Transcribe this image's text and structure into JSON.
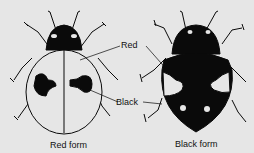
{
  "figure": {
    "labels": {
      "red": "Red",
      "black": "Black"
    },
    "captions": {
      "left": "Red form",
      "right": "Black form"
    },
    "colors": {
      "background": "#e6e6e6",
      "ink": "#0a0a0a",
      "fill_light": "#e6e6e6"
    }
  }
}
